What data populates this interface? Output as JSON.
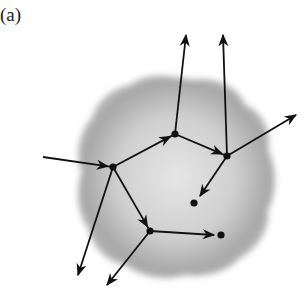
{
  "figure_label": "(a)",
  "colors": {
    "blob": "#9a9a9a",
    "line": "#111111",
    "background": "#ffffff"
  },
  "nodes": [
    {
      "id": "A",
      "x": 113,
      "y": 167
    },
    {
      "id": "B",
      "x": 175,
      "y": 134
    },
    {
      "id": "C",
      "x": 227,
      "y": 156
    },
    {
      "id": "D",
      "x": 150,
      "y": 231
    },
    {
      "id": "E",
      "x": 194,
      "y": 203
    },
    {
      "id": "F",
      "x": 221,
      "y": 235
    }
  ],
  "arrows": [
    {
      "from": [
        43,
        157
      ],
      "to": [
        113,
        167
      ],
      "mid": true
    },
    {
      "from": [
        113,
        167
      ],
      "to": [
        175,
        134
      ],
      "mid": true
    },
    {
      "from": [
        175,
        134
      ],
      "to": [
        227,
        156
      ],
      "mid": true
    },
    {
      "from": [
        175,
        134
      ],
      "to": [
        186,
        35
      ],
      "tip": true
    },
    {
      "from": [
        227,
        156
      ],
      "to": [
        223,
        35
      ],
      "tip": true
    },
    {
      "from": [
        227,
        156
      ],
      "to": [
        296,
        115
      ],
      "tip": true
    },
    {
      "from": [
        227,
        156
      ],
      "to": [
        200,
        196
      ],
      "tip": true
    },
    {
      "from": [
        113,
        167
      ],
      "to": [
        150,
        231
      ],
      "mid": true
    },
    {
      "from": [
        113,
        167
      ],
      "to": [
        78,
        275
      ],
      "tip": true
    },
    {
      "from": [
        150,
        231
      ],
      "to": [
        214,
        235
      ],
      "tip": true
    },
    {
      "from": [
        150,
        231
      ],
      "to": [
        107,
        285
      ],
      "tip": true
    }
  ]
}
